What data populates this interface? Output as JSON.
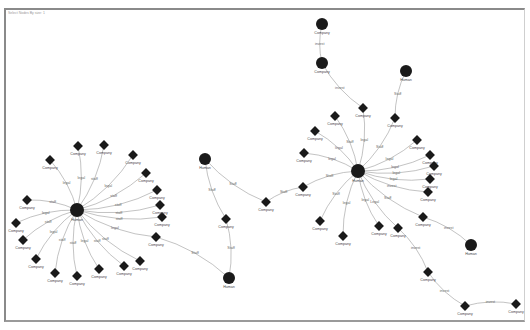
{
  "toolbar": {
    "filter_label": "Select Nodes By size: 1"
  },
  "colors": {
    "node": "#1a1a1a",
    "edge": "#9a9a9a",
    "frame": "#8a8a8a"
  },
  "graph": {
    "nodes": [
      {
        "id": "h1",
        "label": "Human",
        "shape": "circle",
        "hub": true
      },
      {
        "id": "c1",
        "label": "Company",
        "shape": "diamond"
      },
      {
        "id": "c2",
        "label": "Company",
        "shape": "diamond"
      },
      {
        "id": "c3",
        "label": "Company",
        "shape": "diamond"
      },
      {
        "id": "c4",
        "label": "Company",
        "shape": "diamond"
      },
      {
        "id": "c5",
        "label": "Company",
        "shape": "diamond"
      },
      {
        "id": "c6",
        "label": "Company",
        "shape": "diamond"
      },
      {
        "id": "c7",
        "label": "Company",
        "shape": "diamond"
      },
      {
        "id": "c8",
        "label": "Company",
        "shape": "diamond"
      },
      {
        "id": "c9",
        "label": "Company",
        "shape": "diamond"
      },
      {
        "id": "c10",
        "label": "Company",
        "shape": "diamond"
      },
      {
        "id": "c11",
        "label": "Company",
        "shape": "diamond"
      },
      {
        "id": "c12",
        "label": "Company",
        "shape": "diamond"
      },
      {
        "id": "c13",
        "label": "Company",
        "shape": "diamond"
      },
      {
        "id": "c14",
        "label": "Company",
        "shape": "diamond"
      },
      {
        "id": "c15",
        "label": "Company",
        "shape": "diamond"
      },
      {
        "id": "c16",
        "label": "Company",
        "shape": "diamond"
      },
      {
        "id": "c17",
        "label": "Company",
        "shape": "diamond"
      },
      {
        "id": "c18",
        "label": "Company",
        "shape": "diamond"
      },
      {
        "id": "h2",
        "label": "Human",
        "shape": "circle"
      },
      {
        "id": "h3",
        "label": "Human",
        "shape": "circle"
      },
      {
        "id": "m1",
        "label": "Company",
        "shape": "diamond"
      },
      {
        "id": "m2",
        "label": "Company",
        "shape": "diamond"
      },
      {
        "id": "h4",
        "label": "Human",
        "shape": "circle",
        "hub": true
      },
      {
        "id": "r1",
        "label": "Company",
        "shape": "diamond"
      },
      {
        "id": "r2",
        "label": "Company",
        "shape": "diamond"
      },
      {
        "id": "r3",
        "label": "Company",
        "shape": "diamond"
      },
      {
        "id": "r4",
        "label": "Company",
        "shape": "diamond"
      },
      {
        "id": "r5",
        "label": "Company",
        "shape": "diamond"
      },
      {
        "id": "r6",
        "label": "Company",
        "shape": "diamond"
      },
      {
        "id": "r7",
        "label": "Company",
        "shape": "diamond"
      },
      {
        "id": "r8",
        "label": "Company",
        "shape": "diamond"
      },
      {
        "id": "r9",
        "label": "Company",
        "shape": "diamond"
      },
      {
        "id": "r10",
        "label": "Company",
        "shape": "diamond"
      },
      {
        "id": "r11",
        "label": "Company",
        "shape": "diamond"
      },
      {
        "id": "r12",
        "label": "Company",
        "shape": "diamond"
      },
      {
        "id": "r13",
        "label": "Company",
        "shape": "diamond"
      },
      {
        "id": "r14",
        "label": "Company",
        "shape": "diamond"
      },
      {
        "id": "r15",
        "label": "Company",
        "shape": "diamond"
      },
      {
        "id": "r16",
        "label": "Company",
        "shape": "diamond"
      },
      {
        "id": "t1",
        "label": "Company",
        "shape": "circle"
      },
      {
        "id": "t2",
        "label": "Company",
        "shape": "circle"
      },
      {
        "id": "h5",
        "label": "Human",
        "shape": "circle"
      },
      {
        "id": "h6",
        "label": "Human",
        "shape": "circle"
      },
      {
        "id": "b1",
        "label": "Company",
        "shape": "diamond"
      },
      {
        "id": "b2",
        "label": "Company",
        "shape": "diamond"
      },
      {
        "id": "b3",
        "label": "Company",
        "shape": "diamond"
      }
    ],
    "edges": [
      {
        "from": "h1",
        "to": "c1",
        "label": "legal"
      },
      {
        "from": "h1",
        "to": "c2",
        "label": "staff"
      },
      {
        "from": "h1",
        "to": "c3",
        "label": "legal"
      },
      {
        "from": "h1",
        "to": "c4",
        "label": "staff"
      },
      {
        "from": "h1",
        "to": "c5",
        "label": "staff"
      },
      {
        "from": "h1",
        "to": "c6",
        "label": "staff"
      },
      {
        "from": "h1",
        "to": "c7",
        "label": "staff"
      },
      {
        "from": "h1",
        "to": "c8",
        "label": "legal"
      },
      {
        "from": "h1",
        "to": "c9",
        "label": "staff"
      },
      {
        "from": "h1",
        "to": "c10",
        "label": "staff"
      },
      {
        "from": "h1",
        "to": "c11",
        "label": "legal"
      },
      {
        "from": "h1",
        "to": "c12",
        "label": "staff"
      },
      {
        "from": "h1",
        "to": "c13",
        "label": "staff"
      },
      {
        "from": "h1",
        "to": "c14",
        "label": "legal"
      },
      {
        "from": "h1",
        "to": "c15",
        "label": "staff"
      },
      {
        "from": "h1",
        "to": "c16",
        "label": "legal"
      },
      {
        "from": "h1",
        "to": "c17",
        "label": "staff"
      },
      {
        "from": "h1",
        "to": "c18",
        "label": "legal"
      },
      {
        "from": "h3",
        "to": "c8",
        "label": "Staff"
      },
      {
        "from": "h2",
        "to": "m1",
        "label": "Staff"
      },
      {
        "from": "h2",
        "to": "m2",
        "label": "Staff"
      },
      {
        "from": "h3",
        "to": "m2",
        "label": "Staff"
      },
      {
        "from": "r10",
        "to": "m1",
        "label": "Staff"
      },
      {
        "from": "h4",
        "to": "r1",
        "label": "Staff"
      },
      {
        "from": "h4",
        "to": "r2",
        "label": "legal"
      },
      {
        "from": "h4",
        "to": "r3",
        "label": "Staff"
      },
      {
        "from": "h4",
        "to": "r4",
        "label": "legal"
      },
      {
        "from": "h4",
        "to": "r5",
        "label": "legal"
      },
      {
        "from": "h4",
        "to": "r6",
        "label": "legal"
      },
      {
        "from": "h4",
        "to": "r7",
        "label": "legal"
      },
      {
        "from": "h4",
        "to": "r8",
        "label": "legal"
      },
      {
        "from": "h4",
        "to": "r9",
        "label": "invest"
      },
      {
        "from": "h4",
        "to": "r10",
        "label": "Staff"
      },
      {
        "from": "h4",
        "to": "r11",
        "label": "Staff"
      },
      {
        "from": "h4",
        "to": "r12",
        "label": "legal"
      },
      {
        "from": "h4",
        "to": "r13",
        "label": "legal"
      },
      {
        "from": "h4",
        "to": "r14",
        "label": "Legal"
      },
      {
        "from": "h4",
        "to": "r15",
        "label": "Staff"
      },
      {
        "from": "h4",
        "to": "r16",
        "label": "legal"
      },
      {
        "from": "t1",
        "to": "t2",
        "label": "invest"
      },
      {
        "from": "t2",
        "to": "r2",
        "label": "invest"
      },
      {
        "from": "h5",
        "to": "r3",
        "label": "Staff"
      },
      {
        "from": "h6",
        "to": "r15",
        "label": "invest"
      },
      {
        "from": "b1",
        "to": "r14",
        "label": "invest"
      },
      {
        "from": "b1",
        "to": "b2",
        "label": "invest"
      },
      {
        "from": "b3",
        "to": "b2",
        "label": "invest"
      }
    ]
  }
}
